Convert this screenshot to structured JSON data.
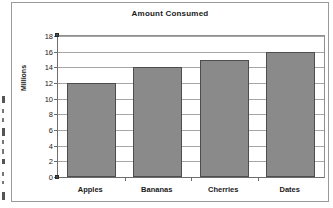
{
  "chart_data": {
    "type": "bar",
    "title": "Amount Consumed",
    "xlabel": "",
    "ylabel": "Millions",
    "categories": [
      "Apples",
      "Bananas",
      "Cherries",
      "Dates"
    ],
    "values": [
      12,
      14,
      15,
      16
    ],
    "ylim": [
      0,
      18
    ],
    "ytick_step": 2,
    "yticks": [
      0,
      2,
      4,
      6,
      8,
      10,
      12,
      14,
      16,
      18
    ],
    "ytick_labels": [
      "0",
      "2",
      "4",
      "6",
      "8",
      "10",
      "12",
      "14",
      "16",
      "18"
    ],
    "grid": true,
    "grid_axis": "y",
    "legend": false,
    "legend_position": "none",
    "series": [
      {
        "name": "Amount Consumed",
        "values": [
          12,
          14,
          15,
          16
        ]
      }
    ],
    "colors": {
      "bar_fill": "#8a8a8a",
      "bar_border": "#4d4d4d",
      "gridline": "#a6a6a6",
      "axis": "#6d6d6d",
      "plot_border": "#8f8f8f",
      "frame_border": "#9a9a9a",
      "text": "#1a1a1a",
      "background": "#ffffff"
    }
  },
  "artifacts": {
    "description": "scan-edge-marks",
    "marks": [
      {
        "top": 96,
        "height": 7,
        "kind": "small"
      },
      {
        "top": 109,
        "height": 4,
        "kind": "tiny"
      },
      {
        "top": 118,
        "height": 4,
        "kind": "tiny"
      },
      {
        "top": 128,
        "height": 8,
        "kind": "small"
      },
      {
        "top": 140,
        "height": 4,
        "kind": "tiny"
      },
      {
        "top": 149,
        "height": 5,
        "kind": "tiny"
      },
      {
        "top": 159,
        "height": 5,
        "kind": "small"
      },
      {
        "top": 172,
        "height": 4,
        "kind": "tiny"
      },
      {
        "top": 181,
        "height": 3,
        "kind": "tiny"
      },
      {
        "top": 192,
        "height": 8,
        "kind": "small"
      }
    ]
  }
}
